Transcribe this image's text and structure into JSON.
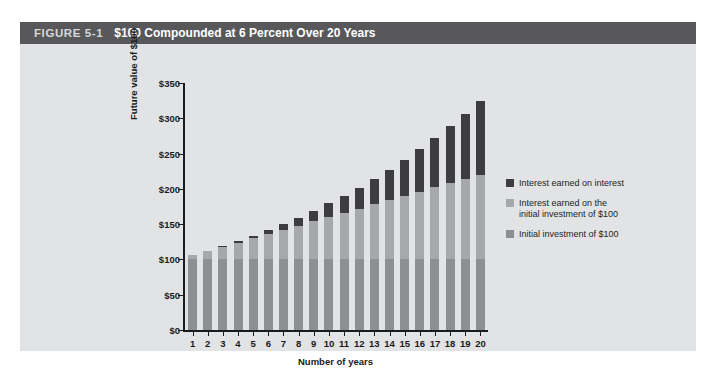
{
  "figure": {
    "number": "FIGURE 5-1",
    "title": "$100 Compounded at 6 Percent Over 20 Years"
  },
  "legend": {
    "items": [
      {
        "label": "Interest earned on interest",
        "color": "#3d3d40",
        "swatch_name": "legend-swatch-interest-on-interest"
      },
      {
        "label": "Interest earned on the\ninitial investment of $100",
        "color": "#a6a8ab",
        "swatch_name": "legend-swatch-simple-interest"
      },
      {
        "label": "Initial investment of $100",
        "color": "#8d9093",
        "swatch_name": "legend-swatch-principal"
      }
    ]
  },
  "chart_data": {
    "type": "bar",
    "stacked": true,
    "title": "$100 Compounded at 6 Percent Over 20 Years",
    "xlabel": "Number of years",
    "ylabel": "Future value of $100",
    "categories": [
      "1",
      "2",
      "3",
      "4",
      "5",
      "6",
      "7",
      "8",
      "9",
      "10",
      "11",
      "12",
      "13",
      "14",
      "15",
      "16",
      "17",
      "18",
      "19",
      "20"
    ],
    "ylim": [
      0,
      350
    ],
    "yticks": [
      "$0",
      "$50",
      "$100",
      "$150",
      "$200",
      "$250",
      "$300",
      "$350"
    ],
    "ytick_values": [
      0,
      50,
      100,
      150,
      200,
      250,
      300,
      350
    ],
    "grid": false,
    "legend_position": "right",
    "series": [
      {
        "name": "Initial investment of $100",
        "color": "#8d9093",
        "values": [
          100,
          100,
          100,
          100,
          100,
          100,
          100,
          100,
          100,
          100,
          100,
          100,
          100,
          100,
          100,
          100,
          100,
          100,
          100,
          100
        ]
      },
      {
        "name": "Interest earned on the initial investment of $100",
        "color": "#a6a8ab",
        "values": [
          6,
          12,
          18,
          24,
          30,
          36,
          42,
          48,
          54,
          60,
          66,
          72,
          78,
          84,
          90,
          96,
          102,
          108,
          114,
          120
        ]
      },
      {
        "name": "Interest earned on interest",
        "color": "#3d3d40",
        "values": [
          0,
          0.36,
          1.1,
          2.25,
          3.82,
          5.85,
          8.38,
          11.44,
          15.08,
          19.32,
          24.22,
          29.81,
          36.13,
          43.24,
          51.18,
          60.0,
          69.76,
          80.51,
          92.31,
          105.21
        ]
      }
    ],
    "totals": [
      106.0,
      112.36,
      119.1,
      126.25,
      133.82,
      141.85,
      150.36,
      159.38,
      168.95,
      179.08,
      189.83,
      201.22,
      213.29,
      226.09,
      239.66,
      254.04,
      269.28,
      285.43,
      302.56,
      320.71
    ]
  }
}
